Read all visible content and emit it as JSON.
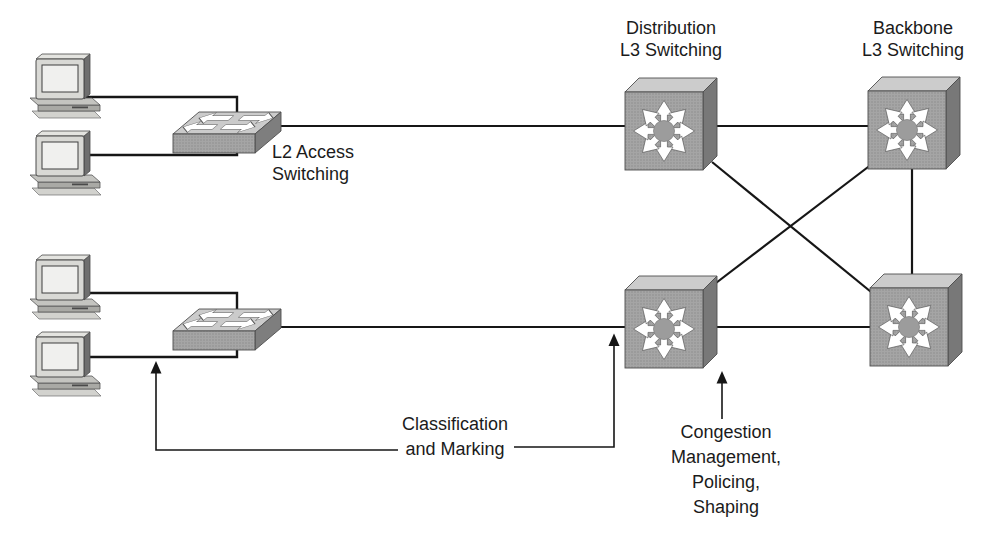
{
  "figure": {
    "type": "network-topology-diagram",
    "background": "#ffffff",
    "line_color": "#161616",
    "text_color": "#1b1b1b"
  },
  "palette": {
    "switch_front": "#a5a5a5",
    "switch_front_dot": "#8f8f8f",
    "switch_top": "#cccccc",
    "switch_side": "#787878",
    "arrow_white": "#ffffff",
    "pc_body": "#d9d9d5",
    "pc_screen": "#f0f0ee"
  },
  "labels": {
    "distribution": {
      "lines": [
        "Distribution",
        "L3 Switching"
      ]
    },
    "backbone": {
      "lines": [
        "Backbone",
        "L3 Switching"
      ]
    },
    "l2_access": {
      "lines": [
        "L2 Access",
        "Switching"
      ]
    },
    "classification": {
      "lines": [
        "Classification",
        "and Marking"
      ]
    },
    "congestion": {
      "lines": [
        "Congestion",
        "Management,",
        "Policing,",
        "Shaping"
      ]
    }
  },
  "nodes": [
    {
      "id": "pc-1",
      "type": "pc-icon"
    },
    {
      "id": "pc-2",
      "type": "pc-icon"
    },
    {
      "id": "pc-3",
      "type": "pc-icon"
    },
    {
      "id": "pc-4",
      "type": "pc-icon"
    },
    {
      "id": "access-switch-1",
      "type": "l2-switch-icon"
    },
    {
      "id": "access-switch-2",
      "type": "l2-switch-icon"
    },
    {
      "id": "distribution-switch-1",
      "type": "l3-switch-icon"
    },
    {
      "id": "distribution-switch-2",
      "type": "l3-switch-icon"
    },
    {
      "id": "backbone-switch-1",
      "type": "l3-switch-icon"
    },
    {
      "id": "backbone-switch-2",
      "type": "l3-switch-icon"
    }
  ],
  "edges": [
    [
      "pc-1",
      "access-switch-1"
    ],
    [
      "pc-2",
      "access-switch-1"
    ],
    [
      "pc-3",
      "access-switch-2"
    ],
    [
      "pc-4",
      "access-switch-2"
    ],
    [
      "access-switch-1",
      "distribution-switch-1"
    ],
    [
      "access-switch-2",
      "distribution-switch-2"
    ],
    [
      "distribution-switch-1",
      "backbone-switch-1"
    ],
    [
      "distribution-switch-2",
      "backbone-switch-2"
    ],
    [
      "distribution-switch-1",
      "backbone-switch-2"
    ],
    [
      "distribution-switch-2",
      "backbone-switch-1"
    ],
    [
      "backbone-switch-1",
      "backbone-switch-2"
    ]
  ],
  "callouts": {
    "classification": {
      "points_at": [
        "pc-to-access-link",
        "access-to-distribution-link"
      ]
    },
    "congestion": {
      "points_at": [
        "distribution-switch-2"
      ]
    }
  }
}
